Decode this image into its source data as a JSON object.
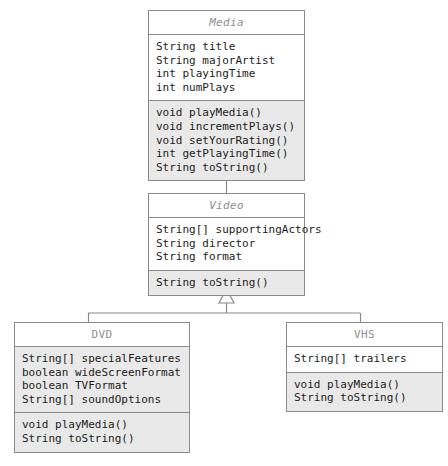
{
  "diagram": {
    "type": "uml-class-diagram",
    "background_color": "#ffffff",
    "border_color": "#8a8a8a",
    "shaded_color": "#e9e9e9",
    "title_text_color": "#8e8e8e",
    "body_text_color": "#1c1c1c",
    "relationship": "generalization"
  },
  "classes": [
    {
      "id": "media",
      "name": "Media",
      "abstract": true,
      "title_shaded": false,
      "attributes": [
        "String title",
        "String majorArtist",
        "int playingTime",
        "int numPlays"
      ],
      "attributes_shaded": false,
      "methods": [
        "void playMedia()",
        "void incrementPlays()",
        "void setYourRating()",
        "int getPlayingTime()",
        "String toString()"
      ],
      "methods_shaded": true,
      "box": {
        "x": 148,
        "y": 10,
        "width": 157,
        "height": 155
      }
    },
    {
      "id": "video",
      "name": "Video",
      "abstract": true,
      "title_shaded": false,
      "attributes": [
        "String[] supportingActors",
        "String director",
        "String format"
      ],
      "attributes_shaded": false,
      "methods": [
        "String toString()"
      ],
      "methods_shaded": true,
      "box": {
        "x": 148,
        "y": 193,
        "width": 157,
        "height": 97
      }
    },
    {
      "id": "dvd",
      "name": "DVD",
      "abstract": false,
      "title_shaded": false,
      "attributes": [
        "String[] specialFeatures",
        "boolean wideScreenFormat",
        "boolean TVFormat",
        "String[] soundOptions"
      ],
      "attributes_shaded": true,
      "methods": [
        "void playMedia()",
        "String toString()"
      ],
      "methods_shaded": true,
      "box": {
        "x": 14,
        "y": 322,
        "width": 176,
        "height": 135
      }
    },
    {
      "id": "vhs",
      "name": "VHS",
      "abstract": false,
      "title_shaded": false,
      "attributes": [
        "String[] trailers"
      ],
      "attributes_shaded": false,
      "methods": [
        "void playMedia()",
        "String toString()"
      ],
      "methods_shaded": true,
      "box": {
        "x": 286,
        "y": 322,
        "width": 157,
        "height": 90
      }
    }
  ],
  "connections": [
    {
      "id": "video-to-media",
      "from": "Video",
      "to": "Media",
      "kind": "generalization"
    },
    {
      "id": "dvd-to-video",
      "from": "DVD",
      "to": "Video",
      "kind": "generalization"
    },
    {
      "id": "vhs-to-video",
      "from": "VHS",
      "to": "Video",
      "kind": "generalization"
    }
  ]
}
